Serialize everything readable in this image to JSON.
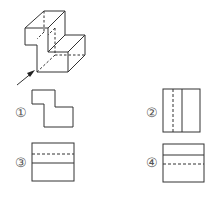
{
  "figure": {
    "arrow_direction": "front-left"
  },
  "options": [
    {
      "label": "①",
      "shape": "L-step outline"
    },
    {
      "label": "②",
      "shape": "rectangle with dashed vertical and solid vertical line"
    },
    {
      "label": "③",
      "shape": "rectangle with dashed horizontal above solid horizontal line"
    },
    {
      "label": "④",
      "shape": "rectangle with solid horizontal above dashed horizontal line"
    }
  ],
  "colors": {
    "line": "#333333",
    "background": "#ffffff"
  }
}
